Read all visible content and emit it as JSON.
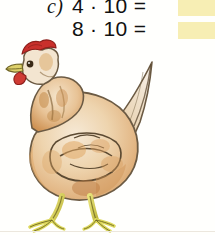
{
  "page": {
    "background_color": "#fffffd",
    "width": 215,
    "height": 235
  },
  "exercise": {
    "label": "c)",
    "rows": [
      {
        "expression": "4 · 10 =",
        "factor_a": "4",
        "operator": "·",
        "factor_b": "10",
        "equals": "=",
        "answer": "",
        "answer_box_color": "#f7eeb4"
      },
      {
        "expression": "8 · 10 =",
        "factor_a": "8",
        "operator": "·",
        "factor_b": "10",
        "equals": "=",
        "answer": "",
        "answer_box_color": "#f7eeb4"
      }
    ]
  },
  "illustration": {
    "name": "hen-illustration",
    "subject": "hen",
    "style": "watercolor",
    "facing": "left",
    "colors": {
      "comb": "#c9302c",
      "comb_dark": "#8d1f1b",
      "wattle": "#cf3b33",
      "beak": "#ddd06a",
      "beak_outline": "#6d6324",
      "eye": "#3a2a16",
      "body_light": "#f3e4cd",
      "body_mid": "#e6c193",
      "body_warm": "#dfa868",
      "body_deep": "#c98b4b",
      "outline": "#6b5a43",
      "feather_stroke": "#5c4a32",
      "leg": "#ddd85c",
      "leg_shade": "#b5ad3c",
      "leg_outline": "#6e6823",
      "shadow": "#a89878"
    }
  },
  "bottom_rule": {
    "color": "#ece7de"
  }
}
